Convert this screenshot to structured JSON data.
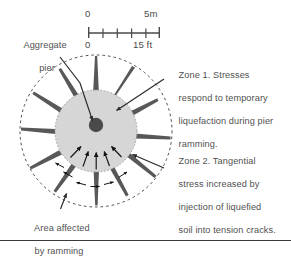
{
  "figure": {
    "background_color": "#ffffff",
    "text_color": "#515151",
    "rule_color": "#3a3a3a"
  },
  "scale_bar": {
    "top_left_label": "0",
    "top_right_label": "5m",
    "bottom_left_label": "0",
    "bottom_right_label": "15 ft",
    "metric_max": 5,
    "metric_unit": "m",
    "imperial_max": 15,
    "imperial_unit": "ft",
    "tick_count": 6
  },
  "labels": {
    "aggregate_pier_line1": "Aggregate",
    "aggregate_pier_line2": "pier",
    "zone1": "Zone 1. Stresses respond to temporary liquefaction during pier ramming.",
    "zone1_lines": [
      "Zone 1. Stresses",
      "respond to temporary",
      "liquefaction during pier",
      "ramming."
    ],
    "zone2": "Zone 2. Tangential stress increased by injection of liquefied soil into tension cracks.",
    "zone2_lines": [
      "Zone 2. Tangential",
      "stress increased by",
      "injection of liquefied",
      "soil into tension cracks."
    ],
    "area_affected_line1": "Area affected",
    "area_affected_line2": "by ramming"
  },
  "diagram": {
    "pier_fill_color": "#d6d6d6",
    "pier_edge_color": "#8c8c8c",
    "pier_center_color": "#4a4a4a",
    "crack_fill_color": "#585858",
    "dashed_circle_color": "#4a4a4a",
    "arrow_color": "#1a1a1a",
    "pier_circle_radius": 41,
    "dashed_circle_radius": 76,
    "center_dot_radius": 7,
    "crack_count": 12,
    "radial_arrow_count": 5,
    "tangential_arrow_count": 6
  }
}
